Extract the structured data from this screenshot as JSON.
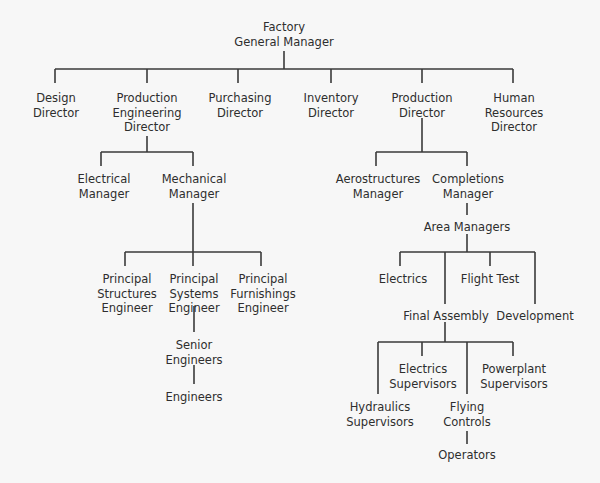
{
  "colors": {
    "background": "#f7f7f7",
    "line": "#3a3a3a",
    "text": "#2e2e2e"
  },
  "nodes": [
    {
      "id": "gm",
      "lines": [
        "Factory",
        "General Manager"
      ],
      "x": 284,
      "y": 20
    },
    {
      "id": "design",
      "lines": [
        "Design",
        "Director"
      ],
      "x": 56,
      "y": 91
    },
    {
      "id": "prodeng",
      "lines": [
        "Production",
        "Engineering",
        "Director"
      ],
      "x": 147,
      "y": 91
    },
    {
      "id": "purch",
      "lines": [
        "Purchasing",
        "Director"
      ],
      "x": 240,
      "y": 91
    },
    {
      "id": "inv",
      "lines": [
        "Inventory",
        "Director"
      ],
      "x": 331,
      "y": 91
    },
    {
      "id": "proddir",
      "lines": [
        "Production",
        "Director"
      ],
      "x": 422,
      "y": 91
    },
    {
      "id": "hr",
      "lines": [
        "Human",
        "Resources",
        "Director"
      ],
      "x": 514,
      "y": 91
    },
    {
      "id": "elecmgr",
      "lines": [
        "Electrical",
        "Manager"
      ],
      "x": 104,
      "y": 172
    },
    {
      "id": "mechmgr",
      "lines": [
        "Mechanical",
        "Manager"
      ],
      "x": 194,
      "y": 172
    },
    {
      "id": "aero",
      "lines": [
        "Aerostructures",
        "Manager"
      ],
      "x": 378,
      "y": 172
    },
    {
      "id": "compl",
      "lines": [
        "Completions",
        "Manager"
      ],
      "x": 468,
      "y": 172
    },
    {
      "id": "area",
      "lines": [
        "Area Managers"
      ],
      "x": 467,
      "y": 220
    },
    {
      "id": "pse",
      "lines": [
        "Principal",
        "Structures",
        "Engineer"
      ],
      "x": 127,
      "y": 272
    },
    {
      "id": "psys",
      "lines": [
        "Principal",
        "Systems",
        "Engineer"
      ],
      "x": 194,
      "y": 272
    },
    {
      "id": "pfe",
      "lines": [
        "Principal",
        "Furnishings",
        "Engineer"
      ],
      "x": 263,
      "y": 272
    },
    {
      "id": "electrics",
      "lines": [
        "Electrics"
      ],
      "x": 403,
      "y": 272
    },
    {
      "id": "flight",
      "lines": [
        "Flight Test"
      ],
      "x": 490,
      "y": 272
    },
    {
      "id": "final",
      "lines": [
        "Final Assembly"
      ],
      "x": 446,
      "y": 309
    },
    {
      "id": "dev",
      "lines": [
        "Development"
      ],
      "x": 535,
      "y": 309
    },
    {
      "id": "senior",
      "lines": [
        "Senior",
        "Engineers"
      ],
      "x": 194,
      "y": 338
    },
    {
      "id": "engineers",
      "lines": [
        "Engineers"
      ],
      "x": 194,
      "y": 390
    },
    {
      "id": "elecsup",
      "lines": [
        "Electrics",
        "Supervisors"
      ],
      "x": 423,
      "y": 362
    },
    {
      "id": "power",
      "lines": [
        "Powerplant",
        "Supervisors"
      ],
      "x": 514,
      "y": 362
    },
    {
      "id": "hyd",
      "lines": [
        "Hydraulics",
        "Supervisors"
      ],
      "x": 380,
      "y": 400
    },
    {
      "id": "flying",
      "lines": [
        "Flying",
        "Controls"
      ],
      "x": 467,
      "y": 400
    },
    {
      "id": "operators",
      "lines": [
        "Operators"
      ],
      "x": 467,
      "y": 448
    }
  ],
  "connectors": [
    [
      284,
      51,
      284,
      69
    ],
    [
      55,
      69,
      513,
      69
    ],
    [
      55,
      69,
      55,
      83
    ],
    [
      147,
      69,
      147,
      83
    ],
    [
      238,
      69,
      238,
      83
    ],
    [
      331,
      69,
      331,
      83
    ],
    [
      422,
      69,
      422,
      83
    ],
    [
      513,
      69,
      513,
      83
    ],
    [
      147,
      136,
      147,
      152
    ],
    [
      101,
      152,
      193,
      152
    ],
    [
      101,
      152,
      101,
      166
    ],
    [
      193,
      152,
      193,
      166
    ],
    [
      193,
      203,
      193,
      252
    ],
    [
      125,
      252,
      261,
      252
    ],
    [
      125,
      252,
      125,
      266
    ],
    [
      193,
      252,
      193,
      266
    ],
    [
      261,
      252,
      261,
      266
    ],
    [
      422,
      118,
      422,
      152
    ],
    [
      376,
      152,
      467,
      152
    ],
    [
      376,
      152,
      376,
      166
    ],
    [
      467,
      152,
      467,
      166
    ],
    [
      467,
      203,
      467,
      215
    ],
    [
      467,
      234,
      467,
      252
    ],
    [
      400,
      252,
      535,
      252
    ],
    [
      400,
      252,
      400,
      266
    ],
    [
      445,
      252,
      445,
      304
    ],
    [
      490,
      252,
      490,
      266
    ],
    [
      535,
      252,
      535,
      304
    ],
    [
      445,
      322,
      445,
      342
    ],
    [
      378,
      342,
      513,
      342
    ],
    [
      378,
      342,
      378,
      394
    ],
    [
      422,
      342,
      422,
      356
    ],
    [
      467,
      342,
      467,
      394
    ],
    [
      513,
      342,
      513,
      356
    ],
    [
      467,
      431,
      467,
      444
    ],
    [
      194,
      306,
      194,
      332
    ],
    [
      194,
      365,
      194,
      384
    ]
  ]
}
